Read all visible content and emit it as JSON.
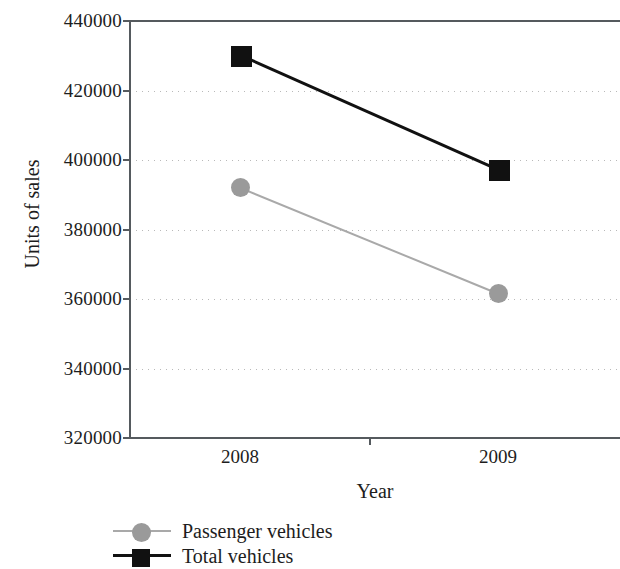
{
  "chart_data": {
    "type": "line",
    "title": "",
    "xlabel": "Year",
    "ylabel": "Units of sales",
    "categories": [
      "2008",
      "2009"
    ],
    "x": [
      2008,
      2009
    ],
    "ylim": [
      320000,
      440000
    ],
    "yticks": [
      320000,
      340000,
      360000,
      380000,
      400000,
      420000,
      440000
    ],
    "ytick_labels": [
      "320000",
      "340000",
      "360000",
      "380000",
      "400000",
      "420000",
      "440000"
    ],
    "grid": true,
    "grid_style": "dotted",
    "legend_position": "below-axis-left",
    "series": [
      {
        "name": "Passenger vehicles",
        "values": [
          392000,
          361500
        ],
        "marker": "circle",
        "color": "#9a9a9a",
        "line_color": "#a9a9a9"
      },
      {
        "name": "Total vehicles",
        "values": [
          430200,
          397200
        ],
        "marker": "square",
        "color": "#111111",
        "line_color": "#111111"
      }
    ]
  },
  "legend": {
    "items": [
      {
        "label": "Passenger vehicles",
        "marker": "circle-marker-icon"
      },
      {
        "label": "Total vehicles",
        "marker": "square-marker-icon"
      }
    ]
  }
}
